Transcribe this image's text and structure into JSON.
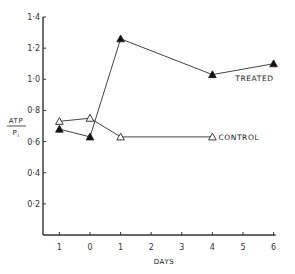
{
  "chart_data": {
    "type": "line",
    "title": "",
    "xlabel": "DAYS",
    "ylabel": "ATP / Pi",
    "ylabel_numerator": "ATP",
    "ylabel_denominator": "Pi",
    "x_tick_values": [
      -1,
      0,
      1,
      2,
      3,
      4,
      5,
      6
    ],
    "x_tick_labels": [
      "1",
      "0",
      "1",
      "2",
      "3",
      "4",
      "5",
      "6"
    ],
    "y_tick_values": [
      0.2,
      0.4,
      0.6,
      0.8,
      1.0,
      1.2,
      1.4
    ],
    "y_tick_labels": [
      "0·2",
      "0·4",
      "0·6",
      "0·8",
      "1·0",
      "1·2",
      "1·4"
    ],
    "xlim": [
      -1.5,
      6
    ],
    "ylim": [
      0,
      1.4
    ],
    "grid": false,
    "legend_position": "inline labels at line ends",
    "series": [
      {
        "name": "TREATED",
        "marker": "filled-triangle",
        "x": [
          -1,
          0,
          1,
          4,
          6
        ],
        "values": [
          0.68,
          0.63,
          1.26,
          1.03,
          1.1
        ]
      },
      {
        "name": "CONTROL",
        "marker": "open-triangle",
        "x": [
          -1,
          0,
          1,
          4
        ],
        "values": [
          0.73,
          0.75,
          0.63,
          0.63
        ]
      }
    ]
  }
}
